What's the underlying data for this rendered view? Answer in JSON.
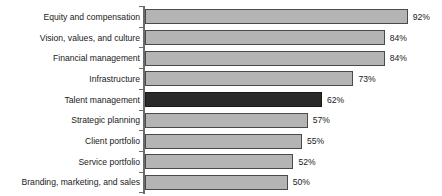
{
  "chart_data": {
    "type": "bar",
    "orientation": "horizontal",
    "title": "",
    "subtitle": "",
    "xlabel": "",
    "ylabel": "",
    "xlim": [
      0,
      100
    ],
    "grid": false,
    "legend": null,
    "value_suffix": "%",
    "categories": [
      "Equity and compensation",
      "Vision, values, and culture",
      "Financial management",
      "Infrastructure",
      "Talent management",
      "Strategic planning",
      "Client portfolio",
      "Service portfolio",
      "Branding, marketing, and sales"
    ],
    "values": [
      92,
      84,
      84,
      73,
      62,
      57,
      55,
      52,
      50
    ],
    "value_labels": [
      "92%",
      "84%",
      "84%",
      "73%",
      "62%",
      "57%",
      "55%",
      "52%",
      "50%"
    ],
    "highlight_index": 4,
    "colors": {
      "bar_fill": "#b4b4b4",
      "bar_stroke": "#4a4a4a",
      "highlight_fill": "#2a2a2a",
      "highlight_stroke": "#1a1a1a",
      "axis": "#6b6b6b",
      "text": "#1a1a1a",
      "background": "#ffffff"
    }
  }
}
